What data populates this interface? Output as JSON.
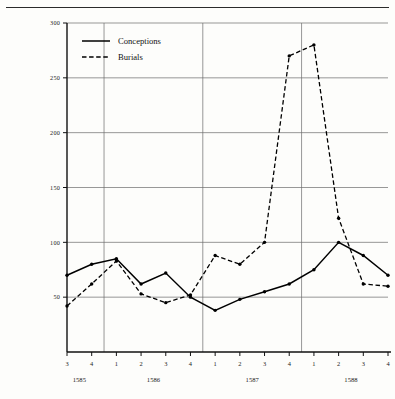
{
  "chart_data": {
    "type": "line",
    "title": "",
    "xlabel": "",
    "ylabel": "",
    "ylim": [
      0,
      300
    ],
    "yticks": [
      50,
      100,
      150,
      200,
      250,
      300
    ],
    "ytick_labels": [
      "50",
      "100",
      "150",
      "200",
      "250",
      "300"
    ],
    "grid": true,
    "legend_position": "top-left",
    "x": [
      "3",
      "4",
      "1",
      "2",
      "3",
      "4",
      "1",
      "2",
      "3",
      "4",
      "1",
      "2",
      "3",
      "4"
    ],
    "xtick_labels": [
      "3",
      "4",
      "1",
      "2",
      "3",
      "4",
      "1",
      "2",
      "3",
      "4",
      "1",
      "2",
      "3",
      "4"
    ],
    "year_labels": [
      {
        "text": "1585",
        "at_index": 0.5
      },
      {
        "text": "1586",
        "at_index": 3.5
      },
      {
        "text": "1587",
        "at_index": 7.5
      },
      {
        "text": "1588",
        "at_index": 11.5
      }
    ],
    "year_boundaries": [
      1.5,
      5.5,
      9.5
    ],
    "series": [
      {
        "name": "Conceptions",
        "style": "solid",
        "values": [
          70,
          80,
          85,
          62,
          72,
          50,
          38,
          48,
          55,
          62,
          75,
          100,
          88,
          70
        ]
      },
      {
        "name": "Burials",
        "style": "dashed",
        "values": [
          42,
          62,
          83,
          53,
          45,
          52,
          88,
          80,
          100,
          270,
          280,
          122,
          62,
          60
        ]
      }
    ],
    "legend": [
      {
        "label": "Conceptions",
        "style": "solid"
      },
      {
        "label": "Burials",
        "style": "dashed"
      }
    ],
    "colors": {
      "ink": "#000000",
      "grid": "#6b6b6b",
      "background": "#fdfdfb"
    }
  }
}
